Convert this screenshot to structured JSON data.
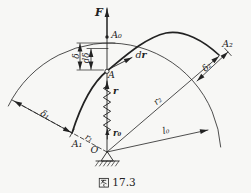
{
  "figure": {
    "caption": {
      "full": "图 17.3",
      "prefix_char": "图",
      "number": "17.3"
    },
    "colors": {
      "ink": "#222222",
      "background": "#f7f7f5"
    },
    "labels": {
      "force": "F",
      "point_a0": "A₀",
      "point_a": "A",
      "point_a1": "A₁",
      "point_a2": "A₂",
      "point_origin": "O",
      "delta": "δ",
      "d_delta": "dδ",
      "displacement_d": "d",
      "displacement_r": "r",
      "radius_vector": "r",
      "unit_vector": "r₀",
      "radius_1": "r₁",
      "radius_2": "r₂",
      "natural_length": "l₀",
      "delta_1": "δ₁",
      "delta_2": "δ₂"
    }
  }
}
